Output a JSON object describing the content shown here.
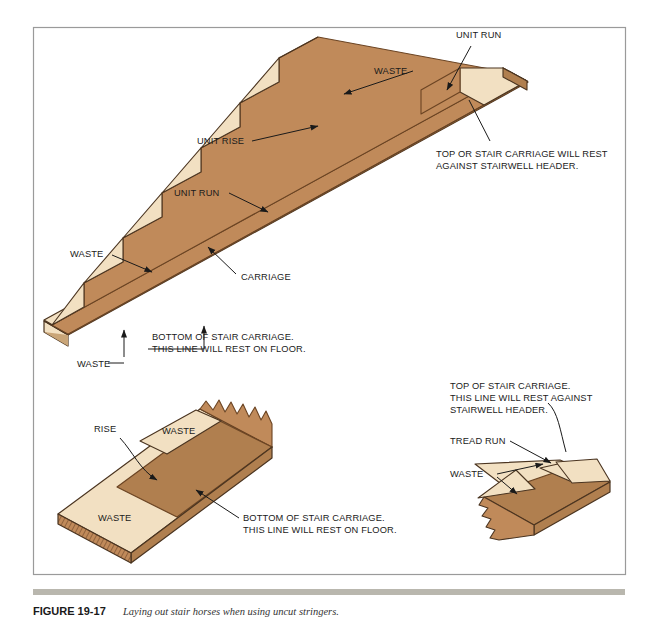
{
  "figure": {
    "border_color": "#9a9a9a",
    "background": "#ffffff",
    "rule_color": "#b9b7ae",
    "caption_number": "FIGURE 19-17",
    "caption_text": "Laying out stair horses when using uncut stringers."
  },
  "palette": {
    "wood_face": "#c08a5a",
    "wood_light": "#f2e0c2",
    "wood_mid": "#b07f4f",
    "wood_dark": "#8a5a30",
    "wood_edge": "#6b4423",
    "outline": "#4a3420",
    "leader": "#1a1a1a"
  },
  "main_drawing": {
    "name": "stair-carriage-layout",
    "labels": [
      {
        "id": "unit-run-top",
        "text": "UNIT RUN",
        "x": 456,
        "y": 38
      },
      {
        "id": "waste-top",
        "text": "WASTE",
        "x": 374,
        "y": 74
      },
      {
        "id": "unit-rise",
        "text": "UNIT RISE",
        "x": 197,
        "y": 144
      },
      {
        "id": "unit-run-mid",
        "text": "UNIT RUN",
        "x": 174,
        "y": 196
      },
      {
        "id": "waste-left",
        "text": "WASTE",
        "x": 70,
        "y": 257
      },
      {
        "id": "carriage",
        "text": "CARRIAGE",
        "x": 241,
        "y": 280
      },
      {
        "id": "waste-bottom",
        "text": "WASTE",
        "x": 77,
        "y": 367
      }
    ],
    "notes": [
      {
        "id": "top-note",
        "lines": [
          "TOP OR STAIR CARRIAGE WILL REST",
          "AGAINST STAIRWELL HEADER."
        ],
        "x": 436,
        "y": 157
      },
      {
        "id": "bottom-note",
        "lines": [
          "BOTTOM OF STAIR CARRIAGE.",
          "THIS LINE WILL REST ON FLOOR."
        ],
        "x": 152,
        "y": 340
      }
    ]
  },
  "detail_left": {
    "name": "bottom-carriage-detail",
    "labels": [
      {
        "id": "rise",
        "text": "RISE",
        "x": 94,
        "y": 432
      },
      {
        "id": "waste-upper",
        "text": "WASTE",
        "x": 162,
        "y": 434
      },
      {
        "id": "waste-lower",
        "text": "WASTE",
        "x": 98,
        "y": 521
      }
    ],
    "notes": [
      {
        "id": "bottom-note-detail",
        "lines": [
          "BOTTOM OF STAIR CARRIAGE.",
          "THIS LINE WILL REST ON FLOOR."
        ],
        "x": 243,
        "y": 521
      }
    ]
  },
  "detail_right": {
    "name": "top-carriage-detail",
    "labels": [
      {
        "id": "tread-run",
        "text": "TREAD RUN",
        "x": 450,
        "y": 444
      },
      {
        "id": "waste-right",
        "text": "WASTE",
        "x": 450,
        "y": 477
      }
    ],
    "notes": [
      {
        "id": "top-note-detail",
        "lines": [
          "TOP OF STAIR CARRIAGE.",
          "THIS LINE WILL REST AGAINST",
          "STAIRWELL HEADER."
        ],
        "x": 450,
        "y": 389
      }
    ]
  }
}
